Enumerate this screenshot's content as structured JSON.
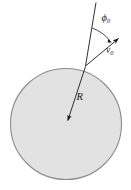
{
  "figure": {
    "type": "physics-diagram",
    "background_color": "#ffffff",
    "circle": {
      "name": "sphere",
      "fill_color": "#e2e2e2",
      "stroke_color": "#808080",
      "center_x": 66,
      "center_y": 124,
      "radius": 56
    },
    "radius_arrow": {
      "label": "R",
      "label_subscript": "",
      "color": "#1a1a1a",
      "from_x": 85,
      "from_y": 66,
      "to_x": 66,
      "to_y": 124
    },
    "radial_extension_line": {
      "name": "radius-extension",
      "color": "#1a1a1a",
      "from_x": 85,
      "from_y": 66,
      "to_x": 96,
      "to_y": 3
    },
    "velocity_arrow": {
      "label": "v",
      "label_subscript": "0",
      "color": "#1a1a1a",
      "from_x": 85,
      "from_y": 66,
      "to_x": 122,
      "to_y": 35
    },
    "angle_arc": {
      "label": "ϕ",
      "label_subscript": "0",
      "color": "#1a1a1a",
      "value_text": "ϕ0"
    },
    "labels": {
      "radius": "R",
      "velocity": "v",
      "velocity_sub": "0",
      "angle": "ϕ",
      "angle_sub": "0"
    }
  }
}
